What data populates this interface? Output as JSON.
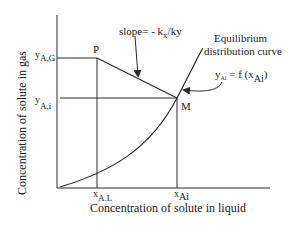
{
  "diagram": {
    "axes": {
      "y_label": "Concentration of solute in gas",
      "x_label": "Concentration of solute in liquid"
    },
    "y_ticks": [
      {
        "main": "y",
        "sub": "A,G"
      },
      {
        "main": "y",
        "sub": "A,i"
      }
    ],
    "x_ticks": [
      {
        "main": "x",
        "sub": "A.L"
      },
      {
        "main": "x",
        "sub": "Ai"
      }
    ],
    "points": {
      "p": "P",
      "m": "M"
    },
    "slope_label": {
      "prefix": "slope= - k",
      "sub1": "x",
      "mid": "/k",
      "sub2": "y"
    },
    "curve_label": {
      "line1": "Equilibrium",
      "line2": "distribution curve"
    },
    "equation": {
      "lhs": "y",
      "lhs_sub": "Ai",
      "rhs": " = f (x",
      "rhs_sub": "Ai",
      "close": ")"
    },
    "colors": {
      "line": "#2a2a2a",
      "background": "#ffffff"
    }
  }
}
